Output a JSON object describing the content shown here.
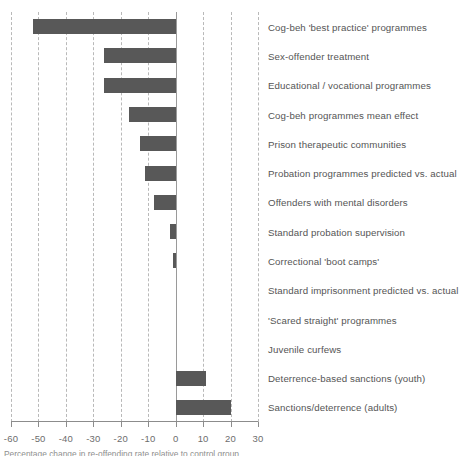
{
  "chart_data": {
    "type": "bar",
    "orientation": "horizontal",
    "title": "",
    "subtitle": "",
    "xlabel": "",
    "ylabel": "",
    "xlim": [
      -60,
      30
    ],
    "ylim": null,
    "grid": true,
    "grid_style": "dashed vertical gridlines",
    "legend": false,
    "legend_position": "none",
    "bar_color": "#585858",
    "xticks": [
      -60,
      -50,
      -40,
      -30,
      -20,
      -10,
      0,
      10,
      20,
      30
    ],
    "xtick_labels": [
      "-60",
      "-50",
      "-40",
      "-30",
      "-20",
      "-10",
      "0",
      "10",
      "20",
      "30"
    ],
    "categories": [
      "Cog-beh 'best practice' programmes",
      "Sex-offender treatment",
      "Educational / vocational programmes",
      "Cog-beh programmes mean effect",
      "Prison therapeutic communities",
      "Probation programmes predicted vs. actual",
      "Offenders with mental disorders",
      "Standard probation supervision",
      "Correctional 'boot camps'",
      "Standard imprisonment predicted vs. actual",
      "'Scared straight' programmes",
      "Juvenile curfews",
      "Deterrence-based sanctions (youth)",
      "Sanctions/deterrence (adults)"
    ],
    "values": [
      -52,
      -26,
      -26,
      -17,
      -13,
      -11,
      -8,
      -2,
      -1,
      0,
      0,
      0,
      11,
      20
    ]
  },
  "caption": {
    "text": "Percentage change in re-offending rate relative to control group"
  }
}
